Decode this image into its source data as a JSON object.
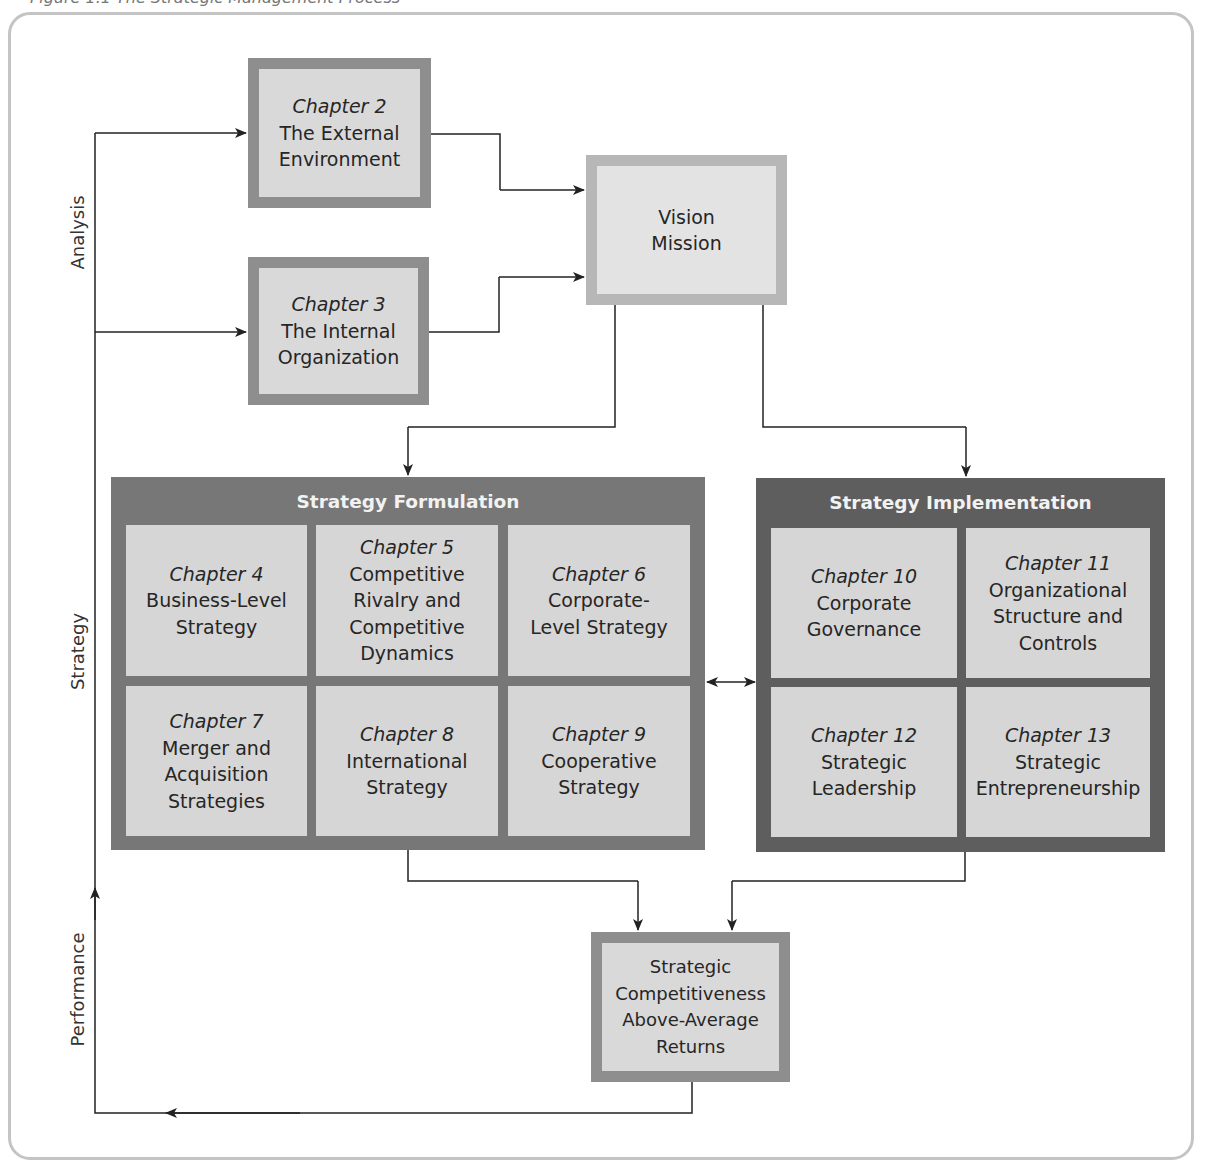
{
  "caption": "Figure 1.1  The Strategic Management Process",
  "side_labels": {
    "analysis": "Analysis",
    "strategy": "Strategy",
    "performance": "Performance"
  },
  "analysis_boxes": [
    {
      "chapter": "Chapter 2",
      "title_lines": [
        "The External",
        "Environment"
      ]
    },
    {
      "chapter": "Chapter 3",
      "title_lines": [
        "The Internal",
        "Organization"
      ]
    }
  ],
  "vision_box": {
    "lines": [
      "Vision",
      "Mission"
    ]
  },
  "formulation": {
    "title": "Strategy Formulation",
    "cells": [
      {
        "chapter": "Chapter 4",
        "lines": [
          "Business-Level",
          "Strategy"
        ]
      },
      {
        "chapter": "Chapter 5",
        "lines": [
          "Competitive",
          "Rivalry and",
          "Competitive",
          "Dynamics"
        ]
      },
      {
        "chapter": "Chapter 6",
        "lines": [
          "Corporate-",
          "Level Strategy"
        ]
      },
      {
        "chapter": "Chapter 7",
        "lines": [
          "Merger and",
          "Acquisition",
          "Strategies"
        ]
      },
      {
        "chapter": "Chapter 8",
        "lines": [
          "International",
          "Strategy"
        ]
      },
      {
        "chapter": "Chapter 9",
        "lines": [
          "Cooperative",
          "Strategy"
        ]
      }
    ]
  },
  "implementation": {
    "title": "Strategy Implementation",
    "cells": [
      {
        "chapter": "Chapter 10",
        "lines": [
          "Corporate",
          "Governance"
        ]
      },
      {
        "chapter": "Chapter 11",
        "lines": [
          "Organizational",
          "Structure and",
          "Controls"
        ]
      },
      {
        "chapter": "Chapter 12",
        "lines": [
          "Strategic",
          "Leadership"
        ]
      },
      {
        "chapter": "Chapter 13",
        "lines": [
          "Strategic",
          "Entrepreneurship"
        ]
      }
    ]
  },
  "outcome_box": {
    "lines": [
      "Strategic",
      "Competitiveness",
      "Above-Average",
      "Returns"
    ]
  },
  "colors": {
    "box_fill": "#d9d9d9",
    "box_border": "#8e8e8e",
    "vision_border": "#b7b7b7",
    "formulation_bg": "#777777",
    "implementation_bg": "#5e5e5e",
    "frame_border": "#c4c4c4"
  }
}
